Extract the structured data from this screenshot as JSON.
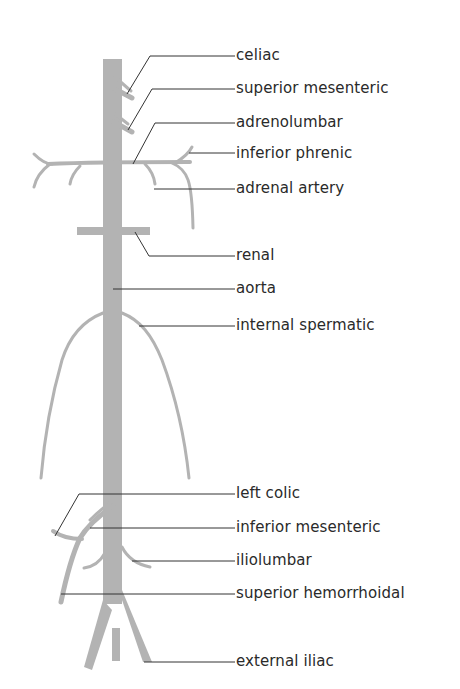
{
  "diagram": {
    "colors": {
      "vessel": "#b3b3b3",
      "leader_line": "#333333",
      "text": "#2a2a2a",
      "background": "#ffffff"
    },
    "labels": [
      {
        "id": "celiac",
        "text": "celiac",
        "y": 56
      },
      {
        "id": "superior-mesenteric",
        "text": "superior mesenteric",
        "y": 89
      },
      {
        "id": "adrenolumbar",
        "text": "adrenolumbar",
        "y": 123
      },
      {
        "id": "inferior-phrenic",
        "text": "inferior phrenic",
        "y": 153
      },
      {
        "id": "adrenal-artery",
        "text": "adrenal artery",
        "y": 189
      },
      {
        "id": "renal",
        "text": "renal",
        "y": 256
      },
      {
        "id": "aorta",
        "text": "aorta",
        "y": 289
      },
      {
        "id": "internal-spermatic",
        "text": "internal spermatic",
        "y": 326
      },
      {
        "id": "left-colic",
        "text": "left colic",
        "y": 494
      },
      {
        "id": "inferior-mesenteric",
        "text": "inferior mesenteric",
        "y": 528
      },
      {
        "id": "iliolumbar",
        "text": "iliolumbar",
        "y": 560
      },
      {
        "id": "superior-hemorrhoidal",
        "text": "superior hemorrhoidal",
        "y": 594
      },
      {
        "id": "external-iliac",
        "text": "external iliac",
        "y": 661
      }
    ]
  }
}
